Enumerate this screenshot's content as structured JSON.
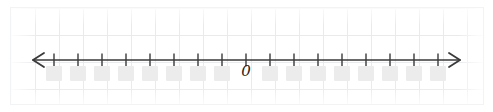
{
  "figure": {
    "name": "blank-number-line-worksheet",
    "width": 493,
    "height": 112,
    "background_color": "#ffffff",
    "paper": {
      "grid_color": "#e9eaec",
      "grid_cell_width": 24,
      "grid_cell_height": 27,
      "left": 11,
      "top": 8,
      "width": 472,
      "height": 96
    }
  },
  "number_line": {
    "axis_color": "#3a3a3a",
    "axis_y": 60,
    "left_arrow_tip_x": 33,
    "right_arrow_tip_x": 460,
    "tick_count": 17,
    "tick_spacing": 24,
    "first_tick_x": 54,
    "tick_height": 13,
    "origin_index": 8,
    "labels": [
      {
        "index": 8,
        "text": "0",
        "style": "italic-serif"
      }
    ],
    "blank_boxes": {
      "color": "#ececec",
      "count": 16,
      "width": 16,
      "height": 15,
      "top": 66,
      "indices": [
        0,
        1,
        2,
        3,
        4,
        5,
        6,
        7,
        9,
        10,
        11,
        12,
        13,
        14,
        15,
        16
      ]
    }
  }
}
